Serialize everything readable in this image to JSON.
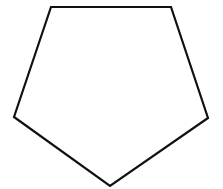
{
  "diagram": {
    "shape": "pentagon",
    "fill": "#ffffff",
    "stroke": "#111111",
    "stroke_width": 2.2,
    "vertices": [
      {
        "x": 51,
        "y": 7
      },
      {
        "x": 171,
        "y": 7
      },
      {
        "x": 208,
        "y": 118
      },
      {
        "x": 110,
        "y": 186
      },
      {
        "x": 14,
        "y": 117
      }
    ]
  }
}
